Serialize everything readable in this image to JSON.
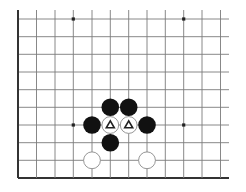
{
  "diagram": {
    "colors": {
      "background": "#ffffff",
      "grid_line": "#7a7a7a",
      "edge_line": "#333333",
      "black_stone": "#111111",
      "white_stone_fill": "#ffffff",
      "white_stone_stroke": "#8a8a8a",
      "marker": "#222222",
      "star_point": "#222222"
    },
    "grid": {
      "x_positions": [
        18,
        36.5,
        55,
        73.3,
        92,
        110.3,
        128.7,
        147,
        165.3,
        183.7,
        202,
        220.5
      ],
      "y_positions": [
        19,
        36.7,
        54.3,
        72,
        89.7,
        107.3,
        125,
        142.7,
        160.3,
        178
      ],
      "line_right_extent": 229,
      "line_top_extent": 10,
      "left_edge_is_board_edge": true,
      "bottom_edge_is_board_edge": true
    },
    "star_points": [
      {
        "col": 3,
        "row": 0
      },
      {
        "col": 9,
        "row": 0
      },
      {
        "col": 3,
        "row": 6
      },
      {
        "col": 9,
        "row": 6
      }
    ],
    "stones": [
      {
        "color": "black",
        "col": 5,
        "row": 5,
        "marker": ""
      },
      {
        "color": "black",
        "col": 6,
        "row": 5,
        "marker": ""
      },
      {
        "color": "black",
        "col": 4,
        "row": 6,
        "marker": ""
      },
      {
        "color": "white",
        "col": 5,
        "row": 6,
        "marker": "triangle"
      },
      {
        "color": "white",
        "col": 6,
        "row": 6,
        "marker": "triangle"
      },
      {
        "color": "black",
        "col": 7,
        "row": 6,
        "marker": ""
      },
      {
        "color": "black",
        "col": 5,
        "row": 7,
        "marker": ""
      },
      {
        "color": "white",
        "col": 4,
        "row": 8,
        "marker": ""
      },
      {
        "color": "white",
        "col": 7,
        "row": 8,
        "marker": ""
      }
    ],
    "stone_radius": 8.8
  }
}
